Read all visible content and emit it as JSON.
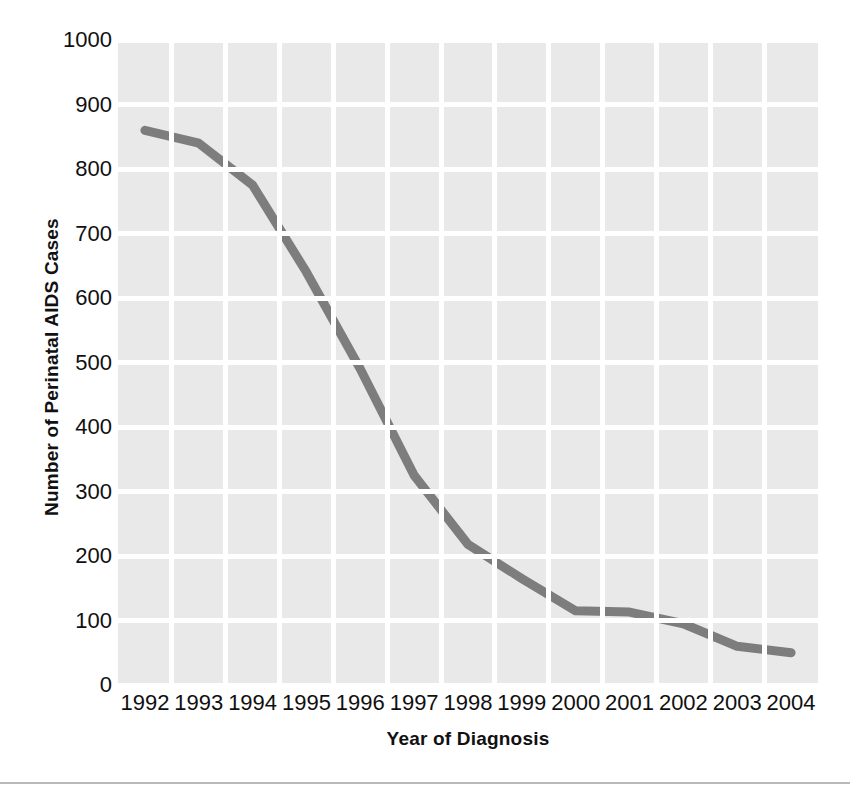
{
  "chart_data": {
    "type": "line",
    "title": "",
    "xlabel": "Year of Diagnosis",
    "ylabel": "Number of Perinatal AIDS Cases",
    "categories": [
      "1992",
      "1993",
      "1994",
      "1995",
      "1996",
      "1997",
      "1998",
      "1999",
      "2000",
      "2001",
      "2002",
      "2003",
      "2004"
    ],
    "values": [
      860,
      840,
      775,
      640,
      490,
      325,
      218,
      165,
      115,
      113,
      95,
      60,
      50
    ],
    "series": [
      {
        "name": "Perinatal AIDS cases",
        "values": [
          860,
          840,
          775,
          640,
          490,
          325,
          218,
          165,
          115,
          113,
          95,
          60,
          50
        ]
      }
    ],
    "ylim": [
      0,
      1000
    ],
    "ytick_labels": [
      "1000",
      "900",
      "800",
      "700",
      "600",
      "500",
      "400",
      "300",
      "200",
      "100",
      "0"
    ],
    "ytick_values": [
      1000,
      900,
      800,
      700,
      600,
      500,
      400,
      300,
      200,
      100,
      0
    ],
    "grid": true,
    "legend_position": "none",
    "line_color": "#7d7d7d",
    "plot_background": "#e9e9e9",
    "grid_color": "#ffffff",
    "text_color": "#101010"
  }
}
